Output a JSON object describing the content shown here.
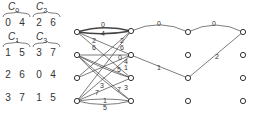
{
  "matrix": {
    "groups": [
      {
        "label": "C",
        "sub": "0",
        "x": 10,
        "y": 2
      },
      {
        "label": "C",
        "sub": "2",
        "x": 38,
        "y": 2
      },
      {
        "label": "C",
        "sub": "1",
        "x": 10,
        "y": 32
      },
      {
        "label": "C",
        "sub": "3",
        "x": 38,
        "y": 32
      }
    ],
    "rows": [
      {
        "y": 18,
        "values": [
          "0",
          "4",
          "2",
          "6"
        ]
      },
      {
        "y": 48,
        "values": [
          "1",
          "5",
          "3",
          "7"
        ]
      },
      {
        "y": 70,
        "values": [
          "2",
          "6",
          "0",
          "4"
        ]
      },
      {
        "y": 93,
        "values": [
          "3",
          "7",
          "1",
          "5"
        ]
      }
    ]
  },
  "graph": {
    "bipartite_left_nodes": [
      [
        77,
        32
      ],
      [
        77,
        55
      ],
      [
        77,
        78
      ],
      [
        77,
        101
      ]
    ],
    "bipartite_right_nodes": [
      [
        131,
        31
      ],
      [
        131,
        55
      ],
      [
        131,
        78
      ],
      [
        131,
        101
      ]
    ],
    "bipartite_edges": [
      {
        "from": 0,
        "to": 0,
        "label": "0",
        "thick": true
      },
      {
        "from": 0,
        "to": 0,
        "label": "4",
        "thick": true
      },
      {
        "from": 0,
        "to": 2,
        "label": "2"
      },
      {
        "from": 0,
        "to": 1,
        "label": "6"
      },
      {
        "from": 3,
        "to": 0,
        "label": "2"
      },
      {
        "from": 2,
        "to": 0,
        "label": "6"
      },
      {
        "from": 1,
        "to": 1,
        "label": "0"
      },
      {
        "from": 2,
        "to": 1,
        "label": "4"
      },
      {
        "from": 1,
        "to": 2,
        "label": "1"
      },
      {
        "from": 1,
        "to": 2,
        "label": "5"
      },
      {
        "from": 3,
        "to": 2,
        "label": "3"
      },
      {
        "from": 3,
        "to": 1,
        "label": "7"
      },
      {
        "from": 1,
        "to": 3,
        "label": "7"
      },
      {
        "from": 1,
        "to": 3,
        "label": "3"
      },
      {
        "from": 3,
        "to": 3,
        "label": "1"
      },
      {
        "from": 3,
        "to": 3,
        "label": "5"
      }
    ],
    "path_nodes": [
      [
        188,
        32
      ],
      [
        188,
        55
      ],
      [
        188,
        78
      ],
      [
        188,
        101
      ],
      [
        243,
        32
      ],
      [
        243,
        55
      ],
      [
        243,
        78
      ],
      [
        243,
        101
      ]
    ],
    "path_edges": [
      {
        "label": "0"
      },
      {
        "label": "0"
      },
      {
        "label": "1"
      },
      {
        "label": "2"
      }
    ]
  }
}
